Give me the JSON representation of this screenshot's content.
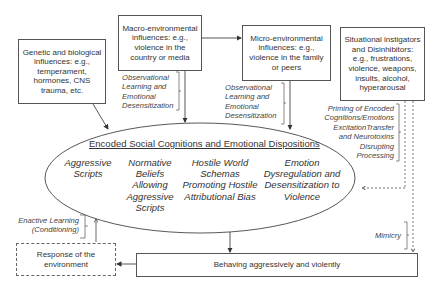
{
  "boxes": {
    "genetic": "Genetic and biological influences: e.g., temperament, hormones, CNS trauma, etc.",
    "macro": "Macro-environmental influences: e.g., violence in the country or media",
    "micro": "Micro-environmental influences: e.g., violence in the family or peers",
    "situational": "Situational instigators and Disinhibitors: e.g., frustrations, violence, weapons, insults, alcohol, hyperarousal",
    "response": "Response of the environment",
    "behaving": "Behaving aggressively and violently"
  },
  "labels": {
    "macro_learning": "Observational Learning and Emotional Desensitization",
    "micro_learning": "Observational Learning and Emotional Desensitization",
    "priming": "Priming of Encoded Cognitions/Emotions ExcitationTransfer and Neurotoxins Disrupting Processing",
    "enactive": "Enactive Learning (Conditioning)",
    "mimicry": "Mimicry"
  },
  "ellipse": {
    "title": "Encoded Social Cognitions and Emotional Dispositions",
    "items": [
      "Aggressive Scripts",
      "Normative Beliefs Allowing Aggressive Scripts",
      "Hostile World Schemas Promoting Hostile Attributional Bias",
      "Emotion Dysregulation and Desensitization to Violence"
    ]
  },
  "colors": {
    "line": "#444444",
    "text": "#333333",
    "background": "#ffffff"
  }
}
